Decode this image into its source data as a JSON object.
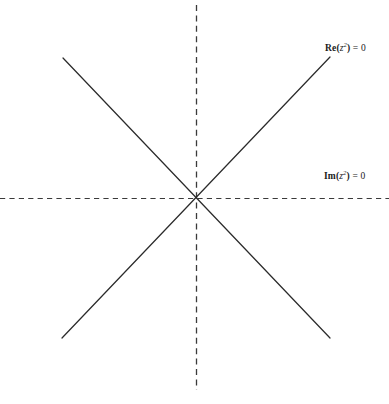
{
  "figure": {
    "width": 389,
    "height": 404,
    "background_color": "#ffffff",
    "line_color": "#2b2b2b",
    "dash_color": "#3a3a3a",
    "text_color": "#1a1a1a"
  },
  "labels": {
    "re": {
      "full_text": "Re(z²) = 0",
      "fn": "Re(",
      "var": "z",
      "exp": "2",
      "close": ")",
      "eq": " = 0"
    },
    "im": {
      "full_text": "Im(z²) = 0",
      "fn": "Im(",
      "var": "z",
      "exp": "2",
      "close": ")",
      "eq": " = 0"
    }
  },
  "chart_data": {
    "type": "line",
    "title": "",
    "xlabel": "",
    "ylabel": "",
    "grid": false,
    "legend": "none",
    "origin": {
      "x": 196,
      "y": 198
    },
    "xlim": [
      0,
      389
    ],
    "ylim": [
      0,
      404
    ],
    "annotations": [
      {
        "name": "re-axis-label",
        "text": "Re(z²) = 0",
        "x": 325,
        "y": 49
      },
      {
        "name": "im-axis-label",
        "text": "Im(z²) = 0",
        "x": 324,
        "y": 177
      }
    ],
    "series": [
      {
        "name": "Im(z^2)=0 horizontal branch",
        "style": "dashed",
        "color": "#3a3a3a",
        "points": [
          [
            0,
            198
          ],
          [
            389,
            198
          ]
        ]
      },
      {
        "name": "Im(z^2)=0 vertical branch",
        "style": "dashed",
        "color": "#3a3a3a",
        "points": [
          [
            196,
            5
          ],
          [
            196,
            390
          ]
        ]
      },
      {
        "name": "Re(z^2)=0 diagonal y=x branch",
        "style": "solid",
        "color": "#2b2b2b",
        "points": [
          [
            62,
            338
          ],
          [
            330,
            57
          ]
        ]
      },
      {
        "name": "Re(z^2)=0 diagonal y=-x branch",
        "style": "solid",
        "color": "#2b2b2b",
        "points": [
          [
            63,
            58
          ],
          [
            330,
            338
          ]
        ]
      }
    ]
  }
}
